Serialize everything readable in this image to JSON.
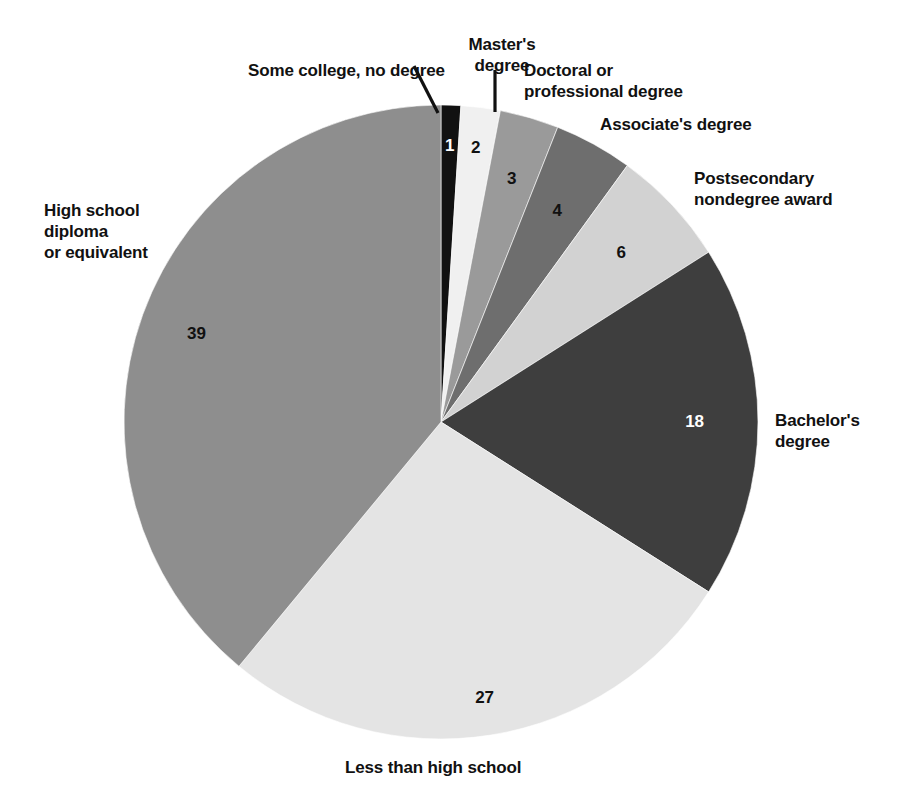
{
  "chart_data": {
    "type": "pie",
    "title": "",
    "subtitle": "",
    "xlabel": "",
    "ylabel": "",
    "legend_position": "none",
    "grid": false,
    "units": "percent",
    "total": 100,
    "start_angle_deg": 0,
    "direction": "clockwise",
    "categories": [
      "Some college, no degree",
      "Master's degree",
      "Doctoral or professional degree",
      "Associate's degree",
      "Postsecondary nondegree award",
      "Bachelor's degree",
      "Less than high school",
      "High school diploma or equivalent"
    ],
    "values": [
      1,
      2,
      3,
      4,
      6,
      18,
      27,
      39
    ],
    "colors": [
      "#111111",
      "#f0f0f0",
      "#9a9a9a",
      "#6e6e6e",
      "#d2d2d2",
      "#3e3e3e",
      "#e4e4e4",
      "#8e8e8e"
    ],
    "slices": [
      {
        "label": "Some college, no degree",
        "value": 1,
        "value_text": "1",
        "color": "#111111",
        "value_color": "#ffffff"
      },
      {
        "label": "Master's degree",
        "value": 2,
        "value_text": "2",
        "color": "#f0f0f0",
        "value_color": "#111111"
      },
      {
        "label": "Doctoral or professional degree",
        "value": 3,
        "value_text": "3",
        "color": "#9a9a9a",
        "value_color": "#111111"
      },
      {
        "label": "Associate's degree",
        "value": 4,
        "value_text": "4",
        "color": "#6e6e6e",
        "value_color": "#111111"
      },
      {
        "label": "Postsecondary nondegree award",
        "value": 6,
        "value_text": "6",
        "color": "#d2d2d2",
        "value_color": "#111111"
      },
      {
        "label": "Bachelor's degree",
        "value": 18,
        "value_text": "18",
        "color": "#3e3e3e",
        "value_color": "#ffffff"
      },
      {
        "label": "Less than high school",
        "value": 27,
        "value_text": "27",
        "color": "#e4e4e4",
        "value_color": "#111111"
      },
      {
        "label": "High school diploma or equivalent",
        "value": 39,
        "value_text": "39",
        "color": "#8e8e8e",
        "value_color": "#111111"
      }
    ]
  },
  "labels": {
    "some_college": "Some college, no degree",
    "masters": "Master's\ndegree",
    "doctoral": "Doctoral or\nprofessional degree",
    "associates": "Associate's degree",
    "postsecondary": "Postsecondary\nnondegree award",
    "bachelors": "Bachelor's\ndegree",
    "less_than_high_school": "Less than high school",
    "high_school": "High school\ndiploma\nor equivalent"
  },
  "values": {
    "some_college": "1",
    "masters": "2",
    "doctoral": "3",
    "associates": "4",
    "postsecondary": "6",
    "bachelors": "18",
    "less_than_high_school": "27",
    "high_school": "39"
  }
}
